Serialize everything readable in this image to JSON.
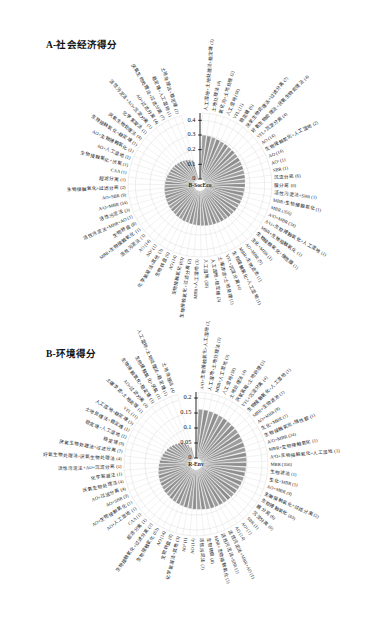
{
  "figure": {
    "panels": [
      {
        "id": "A",
        "title": "A-社会经济得分",
        "center_label": "B-SocEco",
        "axis_ticks": [
          "0",
          "0.1",
          "0.2",
          "0.3",
          "0.4"
        ]
      },
      {
        "id": "B",
        "title": "B-环境得分",
        "center_label": "R-Env",
        "axis_ticks": [
          "0",
          "0.05",
          "0.1",
          "0.15",
          "0.2"
        ]
      }
    ]
  },
  "chart_data": [
    {
      "type": "bar",
      "layout": "polar-radial",
      "title": "A-社会经济得分",
      "center_label": "B-SocEco",
      "xlabel": "",
      "ylabel": "社会经济得分",
      "ylim": [
        0,
        0.45
      ],
      "ytick_values": [
        0,
        0.1,
        0.2,
        0.3,
        0.4
      ],
      "ytick_labels": [
        "0",
        "0.1",
        "0.2",
        "0.3",
        "0.4"
      ],
      "grid": true,
      "legend": "none",
      "bar_color": "#9a9a9a",
      "categories": [
        "人工湿地+土地处理法+稳定塘 (1)",
        "土地处理法 (4)",
        "氧化沟+土地处理 (2)",
        "人工湿地 (58)",
        "VFL (11)",
        "稳定塘 (9)",
        "厌氧生物处理法+过滤分离 (7)",
        "好氧生物处理法+厌氧生物处理法 (4)",
        "VFL+沉淀分离 (4)",
        "AO (14)",
        "生物接触氧化+人工湿地 (2)",
        "AO (14)",
        "AO² (1)",
        "SBR (1)",
        "沉淀分离 (6)",
        "膜分离 (6)",
        "活性污泥法+SBR (1)",
        "MBR+生物接触氧化 (1)",
        "MBR (356)",
        "A²O+MBR (34)",
        "A²O+生物接触氧化+人工湿地 (1)",
        "MBR+生物接触氧化 (1)",
        "生物接触氧化+惰性膜 (1)",
        "生化+MBR (1)",
        "AO+MBR (9)",
        "MBR+生物滤池 (1)",
        "生物接触氧化+人工湿地 (1)",
        "VFL+沉淀分离 (4)",
        "土壤渗滤+土地处理 (1)",
        "人工湿地+稳定塘 (3)",
        "人工湿地 (58)",
        "MBR+人工湿地 (3)",
        "生物接触氧化+过滤分离 (2)",
        "生物接触氧化 (63)",
        "AO (14)",
        "生物转盘 (8)",
        "化学絮凝法+其他 (3)",
        "AO² (1)",
        "AO (14)",
        "活性污泥法 (3)",
        "MBR+生物接触氧化 (1)",
        "生物转盘 (8)",
        "活性污泥法+MBR+AO (1)",
        "活性污泥法 (3)",
        "A²O+MBR (34)",
        "AO+SBR (9)",
        "生物接触氧化+过滤分离 (2)",
        "超滤分离 (1)",
        "CAA (1)",
        "生物接触氧化+厌氧 (1)",
        "AO+人工湿地 (1)",
        "AO+生物接触氧化 (1)",
        "生物接触氧化+稳定塘 (1)",
        "厌氧生物处理法 (4)",
        "化学絮凝法 (1)",
        "活性污泥法+AO+沉淀分离 (1)",
        "AO+过滤分离 (4)",
        "厌氧生物处理法+过滤分离 (7)",
        "稳定塘+人工湿地 (1)",
        "土地处理法+稳定塘 (1)"
      ],
      "values": [
        0.3,
        0.297,
        0.294,
        0.291,
        0.288,
        0.286,
        0.284,
        0.282,
        0.28,
        0.278,
        0.276,
        0.274,
        0.272,
        0.27,
        0.268,
        0.266,
        0.264,
        0.262,
        0.261,
        0.259,
        0.257,
        0.255,
        0.253,
        0.251,
        0.249,
        0.247,
        0.245,
        0.243,
        0.241,
        0.239,
        0.237,
        0.235,
        0.233,
        0.231,
        0.229,
        0.227,
        0.225,
        0.223,
        0.22,
        0.218,
        0.216,
        0.213,
        0.211,
        0.208,
        0.206,
        0.203,
        0.2,
        0.197,
        0.194,
        0.191,
        0.187,
        0.184,
        0.18,
        0.176,
        0.171,
        0.166,
        0.16,
        0.153,
        0.145,
        0.134
      ]
    },
    {
      "type": "bar",
      "layout": "polar-radial",
      "title": "B-环境得分",
      "center_label": "R-Env",
      "xlabel": "",
      "ylabel": "环境得分",
      "ylim": [
        0,
        0.22
      ],
      "ytick_values": [
        0,
        0.05,
        0.1,
        0.15,
        0.2
      ],
      "ytick_labels": [
        "0",
        "0.05",
        "0.1",
        "0.15",
        "0.2"
      ],
      "grid": true,
      "legend": "none",
      "bar_color": "#9a9a9a",
      "categories": [
        "A²O+生物接触氧化+人工湿地 (1)",
        "人工湿地+土地处理法 (1)",
        "MBR+人工湿地 (3)",
        "人工湿地 (58)",
        "土地处理法 (4)",
        "厌氧氢箱+土地处理 (2)",
        "VFL+沉淀分离 (4)",
        "生物接触氧化+人工湿地 (1)",
        "MBR+生物滤池 (1)",
        "AO+MBR (9)",
        "生化+MBR (1)",
        "生物接触氧化+惰性膜 (1)",
        "A²O+MBR (34)",
        "MBR+生物接触氧化 (1)",
        "A²O+生物接触氧化+人工湿地 (1)",
        "MBR (356)",
        "生物滤池 (1)",
        "生化+MBR (1)",
        "AO+MBR (9)",
        "生物接触氧化+过滤分离 (2)",
        "生物接触氧化 (63)",
        "膜分离 (6)",
        "沉淀分离 (6)",
        "SBR (1)",
        "AO² (1)",
        "AO (14)",
        "活性污泥法+MBR+AO (1)",
        "活性污泥法+SBR (1)",
        "MBR+生物接触氧化 (1)",
        "生物转盘 (8)",
        "活性污泥法 (3)",
        "AO (14)",
        "AO² (1)",
        "化学絮凝法+其他 (3)",
        "生物转盘 (8)",
        "AO (14)",
        "生物接触氧化 (63)",
        "生物接触氧化+过滤分离 (2)",
        "超滤分离 (1)",
        "CAA (1)",
        "AO+人工湿地 (1)",
        "AO+生物接触氧化 (1)",
        "AO+SBR (9)",
        "AO+过滤分离 (4)",
        "厌氧生物处理法 (4)",
        "化学絮凝法 (1)",
        "活性污泥法+AO+沉淀分离 (1)",
        "好氧生物处理法+厌氧生物处理法 (4)",
        "厌氧生物处理法+过滤分离 (7)",
        "稳定塘 (9)",
        "稳定塘+人工湿地 (1)",
        "土地处理法+稳定塘 (1)",
        "人工湿地+稳定塘 (3)",
        "VFL (11)",
        "土壤渗滤+土地处理 (1)",
        "AO+过滤分离 (4)",
        "生物接触氧化+稳定塘 (1)",
        "生物接触氧化+厌氧 (1)",
        "人工湿地+土地处理法+稳定塘 (1)",
        "土地处理法 (4)"
      ],
      "values": [
        0.163,
        0.162,
        0.161,
        0.16,
        0.159,
        0.158,
        0.157,
        0.156,
        0.155,
        0.154,
        0.153,
        0.152,
        0.151,
        0.15,
        0.149,
        0.148,
        0.147,
        0.146,
        0.145,
        0.144,
        0.143,
        0.142,
        0.141,
        0.14,
        0.139,
        0.138,
        0.137,
        0.136,
        0.135,
        0.133,
        0.132,
        0.131,
        0.13,
        0.128,
        0.127,
        0.125,
        0.124,
        0.122,
        0.12,
        0.119,
        0.117,
        0.115,
        0.113,
        0.111,
        0.109,
        0.106,
        0.104,
        0.101,
        0.098,
        0.095,
        0.092,
        0.088,
        0.084,
        0.08,
        0.075,
        0.07,
        0.064,
        0.057,
        0.049,
        0.038
      ]
    }
  ]
}
